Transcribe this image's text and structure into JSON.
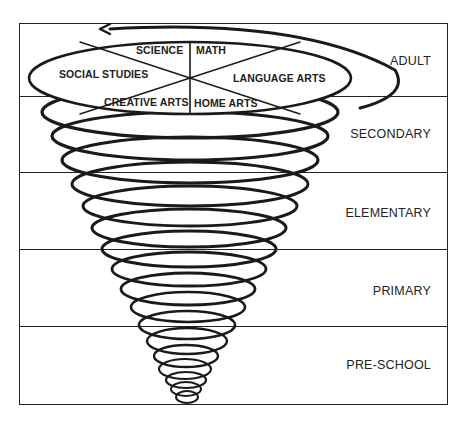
{
  "diagram": {
    "stages": [
      {
        "label": "ADULT"
      },
      {
        "label": "SECONDARY"
      },
      {
        "label": "ELEMENTARY"
      },
      {
        "label": "PRIMARY"
      },
      {
        "label": "PRE-SCHOOL"
      }
    ],
    "subjects": {
      "science": "SCIENCE",
      "math": "MATH",
      "social_studies": "SOCIAL STUDIES",
      "language_arts": "LANGUAGE ARTS",
      "creative_arts": "CREATIVE ARTS",
      "home_arts": "HOME ARTS"
    },
    "colors": {
      "line": "#222222",
      "background": "#ffffff"
    }
  }
}
